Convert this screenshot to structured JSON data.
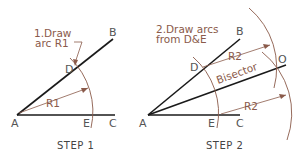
{
  "colors": {
    "line": "#1a1a1a",
    "construction": "#8a5a4a",
    "label": "#555555",
    "background": "#ffffff"
  },
  "step1": {
    "caption": "STEP  1",
    "note_line1": "1.Draw",
    "note_line2": "arc  R1",
    "radius_label": "R1",
    "points": {
      "A": "A",
      "B": "B",
      "C": "C",
      "D": "D",
      "E": "E"
    }
  },
  "step2": {
    "caption": "STEP  2",
    "note_line1": "2.Draw  arcs",
    "note_line2": "from  D&E",
    "radius_label_upper": "R2",
    "radius_label_lower": "R2",
    "bisector_label": "Bisector",
    "points": {
      "A": "A",
      "B": "B",
      "C": "C",
      "D": "D",
      "E": "E",
      "O": "O"
    }
  }
}
